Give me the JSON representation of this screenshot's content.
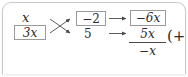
{
  "card": {
    "type": "math-worksheet-card",
    "border_color": "#c9c9c9",
    "background": "#ffffff"
  },
  "diagram": {
    "name": "factoring-cross-multiply-diagram",
    "ink_color": "#2b2b2b",
    "box_border_color": "#9a9a9a",
    "arrow_color": "#4a4a4a",
    "left_column": {
      "top": "x",
      "bottom": "3x",
      "top_boxed": false,
      "bottom_boxed": true
    },
    "middle_column": {
      "top": "−2",
      "bottom": "5",
      "top_boxed": true,
      "bottom_boxed": false
    },
    "right_column": {
      "top": "−6x",
      "top_boxed": true,
      "fraction_numerator": "5x",
      "fraction_denominator": "−x",
      "trailing": "(+"
    },
    "arrows": {
      "cross_count": 2,
      "horizontal_count": 2,
      "cross_labels": [
        "x-to-5",
        "3x-to-minus2"
      ],
      "horizontal_labels": [
        "minus2-to-minus6x",
        "5-to-5x"
      ]
    }
  }
}
